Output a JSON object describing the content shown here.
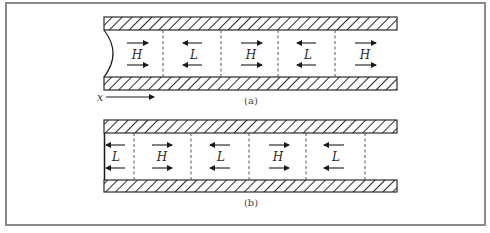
{
  "figure": {
    "panels": [
      {
        "id": "a",
        "caption": "(a)",
        "end_shape": "concave-meniscus",
        "cells": [
          {
            "label": "H",
            "direction": "right"
          },
          {
            "label": "L",
            "direction": "left"
          },
          {
            "label": "H",
            "direction": "right"
          },
          {
            "label": "L",
            "direction": "left"
          },
          {
            "label": "H",
            "direction": "right"
          }
        ]
      },
      {
        "id": "b",
        "caption": "(b)",
        "end_shape": "flat",
        "cells": [
          {
            "label": "L",
            "direction": "left"
          },
          {
            "label": "H",
            "direction": "right"
          },
          {
            "label": "L",
            "direction": "left"
          },
          {
            "label": "H",
            "direction": "right"
          },
          {
            "label": "L",
            "direction": "left"
          }
        ]
      }
    ],
    "axis": {
      "label": "x",
      "direction": "right"
    }
  }
}
